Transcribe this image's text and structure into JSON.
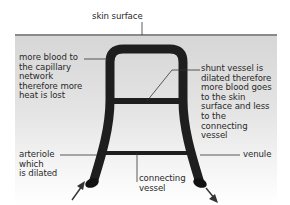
{
  "diagram": {
    "title": "",
    "labels": {
      "skin_surface": "skin surface",
      "capillary_network": "more blood to\nthe capillary\nnetwork\ntherefore more\nheat is lost",
      "shunt_vessel": "shunt vessel is\ndilated therefore\nmore blood goes\nto the skin\nsurface and less\nto the\nconnecting\nvessel",
      "arteriole": "arteriole\nwhich\nis dilated",
      "connecting_vessel": "connecting\nvessel",
      "venule": "venule"
    },
    "colors": {
      "skin_background": "#d6d6d6",
      "skin_line": "#8a8a8a",
      "vessel": "#1e1e1e",
      "leader_line": "#333333",
      "text": "#2a2a2a"
    },
    "arrows": {
      "inflow": "arrow-into-arteriole",
      "outflow": "arrow-out-of-venule"
    }
  }
}
